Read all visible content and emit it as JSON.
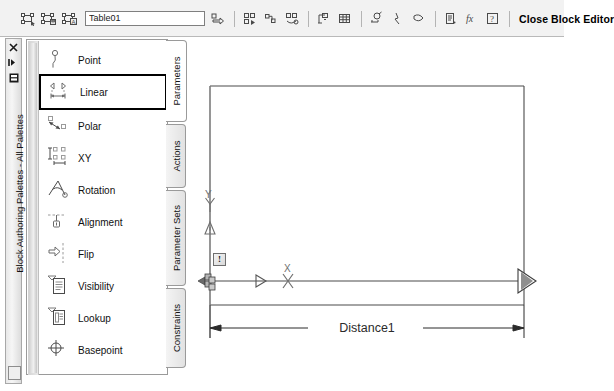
{
  "toolbar": {
    "buttons_left": [
      {
        "name": "edit-block-definition-icon",
        "title": "Edit Block Definition"
      },
      {
        "name": "save-block-definition-icon",
        "title": "Save Block Definition"
      },
      {
        "name": "save-block-as-icon",
        "title": "Save Block As"
      }
    ],
    "block_name_value": "Table01",
    "block_name_placeholder": "Block name",
    "buttons_right": [
      {
        "name": "test-block-icon",
        "title": "Test Block"
      },
      {
        "name": "authoring-palettes-icon",
        "title": "Authoring Palettes"
      },
      {
        "name": "parameter-icon",
        "title": "Parameter"
      },
      {
        "name": "action-icon",
        "title": "Action"
      },
      {
        "name": "define-attribute-icon",
        "title": "Define Attribute"
      },
      {
        "name": "block-table-icon",
        "title": "Block Table"
      },
      {
        "name": "parameter-manager-icon",
        "title": "Parameter Manager"
      },
      {
        "name": "constraint-display-icon",
        "title": "Constraint Display Status"
      },
      {
        "name": "construction-geometry-icon",
        "title": "Construction Geometry"
      },
      {
        "name": "visibility-states-icon",
        "title": "Visibility States"
      },
      {
        "name": "block-properties-table-icon",
        "title": "Block Properties Table"
      },
      {
        "name": "help-icon",
        "title": "Help"
      }
    ],
    "close_label": "Close Block Editor"
  },
  "palette": {
    "anchor_title": "Block Authoring Palettes - All Palettes",
    "anchor_buttons": [
      {
        "name": "close-icon",
        "glyph": "✕"
      },
      {
        "name": "auto-hide-icon",
        "glyph": "▸"
      },
      {
        "name": "palette-properties-icon",
        "glyph": "▣"
      }
    ],
    "items": [
      {
        "label": "Point",
        "icon": "point-parameter-icon",
        "selected": false
      },
      {
        "label": "Linear",
        "icon": "linear-parameter-icon",
        "selected": true
      },
      {
        "label": "Polar",
        "icon": "polar-parameter-icon",
        "selected": false
      },
      {
        "label": "XY",
        "icon": "xy-parameter-icon",
        "selected": false
      },
      {
        "label": "Rotation",
        "icon": "rotation-parameter-icon",
        "selected": false
      },
      {
        "label": "Alignment",
        "icon": "alignment-parameter-icon",
        "selected": false
      },
      {
        "label": "Flip",
        "icon": "flip-parameter-icon",
        "selected": false
      },
      {
        "label": "Visibility",
        "icon": "visibility-parameter-icon",
        "selected": false
      },
      {
        "label": "Lookup",
        "icon": "lookup-parameter-icon",
        "selected": false
      },
      {
        "label": "Basepoint",
        "icon": "basepoint-parameter-icon",
        "selected": false
      }
    ],
    "tabs": [
      {
        "label": "Parameters",
        "active": true
      },
      {
        "label": "Actions",
        "active": false
      },
      {
        "label": "Parameter Sets",
        "active": false
      },
      {
        "label": "Constraints",
        "active": false
      }
    ]
  },
  "canvas": {
    "dimension_label": "Distance1",
    "y_axis_label": "Y",
    "x_axis_label": "X",
    "alert_glyph": "!",
    "warning_glyph": "!",
    "line_color": "#3c3c3c",
    "grip_color": "#7a7a7a"
  }
}
